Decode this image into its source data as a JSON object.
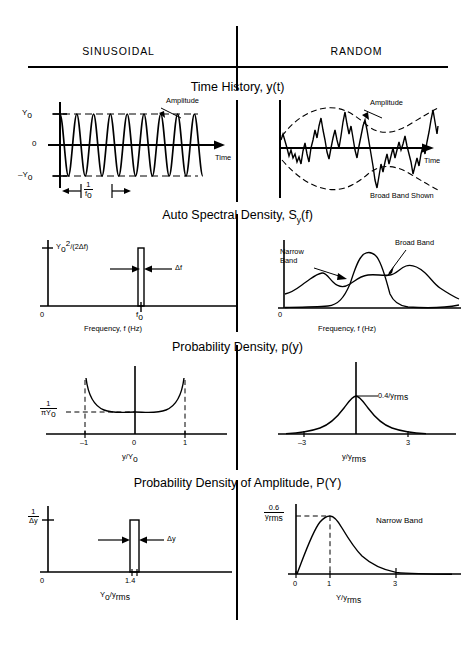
{
  "header": {
    "columns": [
      {
        "label": "SINUSOIDAL"
      },
      {
        "label": "RANDOM"
      }
    ]
  },
  "sections": [
    {
      "id": "time-history",
      "title_main": "Time History, y(t)",
      "title_sub": ""
    },
    {
      "id": "asd",
      "title_main": "Auto Spectral Density, S",
      "title_sub": "y",
      "title_tail": "(f)"
    },
    {
      "id": "pdf",
      "title_main": "Probability Density, p(y)",
      "title_sub": ""
    },
    {
      "id": "pdf-amplitude",
      "title_main": "Probability Density of Amplitude, P(Y)",
      "title_sub": ""
    }
  ],
  "plots": {
    "sin_time": {
      "name": "sinusoidal-time-history",
      "y_top_label": "Y",
      "y_top_sub": "o",
      "y_zero_label": "0",
      "y_bot_label": "–Y",
      "y_bot_sub": "o",
      "x_axis_label": "Time",
      "annotation_amplitude": "Amplitude",
      "period_num": "1",
      "period_den": "f",
      "period_den_sub": "o",
      "cycles": 6,
      "amplitude": 1.0
    },
    "ran_time": {
      "name": "random-time-history",
      "x_axis_label": "Time",
      "annotation_amplitude": "Amplitude",
      "annotation_band": "Broad Band Shown"
    },
    "sin_asd": {
      "name": "sinusoidal-auto-spectral-density",
      "y_label_main": "Y",
      "y_label_sub": "o",
      "y_label_sup": "2",
      "y_label_tail": "/(2Δf)",
      "x_zero": "0",
      "x_peak": "f",
      "x_peak_sub": "o",
      "delta_label": "Δf",
      "x_axis_label": "Frequency, f (Hz)",
      "peak_value": 1.0
    },
    "ran_asd": {
      "name": "random-auto-spectral-density",
      "x_zero": "0",
      "label_narrow": "Narrow\nBand",
      "label_narrow_line1": "Narrow",
      "label_narrow_line2": "Band",
      "label_broad": "Broad Band",
      "x_axis_label": "Frequency, f (Hz)"
    },
    "sin_pdf": {
      "name": "sinusoidal-probability-density",
      "y_label_num": "1",
      "y_label_den": "πY",
      "y_label_den_sub": "o",
      "x_ticks": [
        "–1",
        "0",
        "1"
      ],
      "x_axis_label": "y/Y",
      "x_axis_label_sub": "o",
      "min_value": 0.3183
    },
    "ran_pdf": {
      "name": "random-probability-density",
      "peak_label": "0.4/y",
      "peak_label_sub": "rms",
      "x_ticks": [
        "–3",
        "3"
      ],
      "x_axis_label": "y/y",
      "x_axis_label_sub": "rms",
      "peak_value": 0.4
    },
    "sin_pdf_amp": {
      "name": "sinusoidal-probability-density-amplitude",
      "y_label_num": "1",
      "y_label_den": "Δy",
      "x_zero": "0",
      "x_peak": "1.4",
      "delta_label": "Δy",
      "x_axis_label": "Y",
      "x_axis_label_sub": "o",
      "x_axis_label_tail": "/y",
      "x_axis_label_sub2": "rms",
      "bar_height": 1.0
    },
    "ran_pdf_amp": {
      "name": "random-probability-density-amplitude",
      "y_label_num": "0.6",
      "y_label_den": "y",
      "y_label_den_sub": "rms",
      "x_ticks": [
        "0",
        "1",
        "3"
      ],
      "annotation_band": "Narrow Band",
      "x_axis_label": "Y/y",
      "x_axis_label_sub": "rms",
      "peak_value": 0.6,
      "peak_x": 1.0
    }
  },
  "colors": {
    "ink": "#000000",
    "paper": "#ffffff"
  }
}
